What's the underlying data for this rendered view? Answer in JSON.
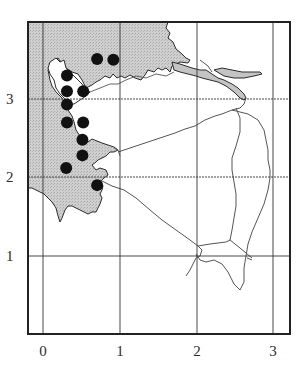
{
  "map": {
    "frame": {
      "left": 28,
      "top": 22,
      "right": 290,
      "bottom": 334
    },
    "colors": {
      "land_fill": "#c9c9c9",
      "coast_stroke": "#2b2b2b",
      "river_stroke": "#555555",
      "grid_stroke": "#333333",
      "dot_fill": "#111111",
      "background": "#ffffff"
    },
    "x_axis": {
      "ticks": [
        {
          "label": "0",
          "px": 43
        },
        {
          "label": "1",
          "px": 120
        },
        {
          "label": "2",
          "px": 197
        },
        {
          "label": "3",
          "px": 273
        }
      ]
    },
    "y_axis": {
      "ticks": [
        {
          "label": "3",
          "px": 99
        },
        {
          "label": "2",
          "px": 177
        },
        {
          "label": "1",
          "px": 256
        }
      ]
    },
    "occurrence_dots": [
      {
        "x": 0.7,
        "y": 3.51
      },
      {
        "x": 0.91,
        "y": 3.5
      },
      {
        "x": 0.31,
        "y": 3.3
      },
      {
        "x": 0.31,
        "y": 3.1
      },
      {
        "x": 0.52,
        "y": 3.1
      },
      {
        "x": 0.31,
        "y": 2.93
      },
      {
        "x": 0.31,
        "y": 2.7
      },
      {
        "x": 0.52,
        "y": 2.7
      },
      {
        "x": 0.51,
        "y": 2.48
      },
      {
        "x": 0.51,
        "y": 2.28
      },
      {
        "x": 0.3,
        "y": 2.12
      },
      {
        "x": 0.7,
        "y": 1.9
      }
    ]
  }
}
